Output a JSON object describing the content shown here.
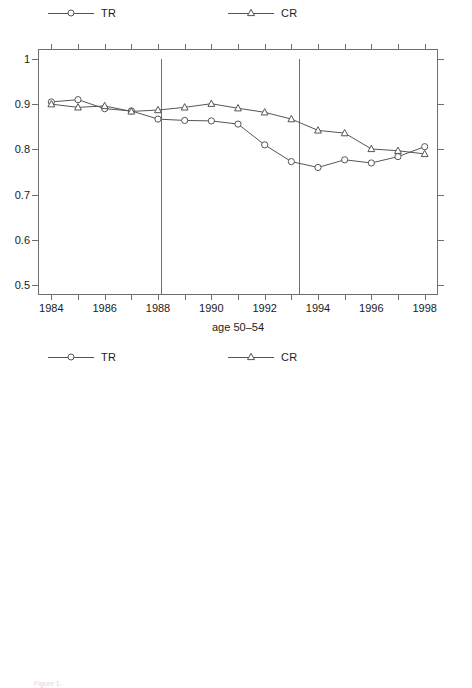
{
  "figure": {
    "caption": "Figure 1.",
    "series_colors": {
      "TR": "#555555",
      "CR": "#555555"
    },
    "axis_color": "#6e6e6e"
  },
  "panels": [
    {
      "id": "panel-age-50-54",
      "legend": [
        {
          "label": "TR",
          "marker": "circle-marker"
        },
        {
          "label": "CR",
          "marker": "triangle-marker"
        }
      ],
      "chart_data": {
        "type": "line",
        "title": "",
        "xlabel": "age 50–54",
        "ylabel": "",
        "x": [
          1984,
          1985,
          1986,
          1987,
          1988,
          1989,
          1990,
          1991,
          1992,
          1993,
          1994,
          1995,
          1996,
          1997,
          1998
        ],
        "xtick_labels": [
          "1984",
          "",
          "1986",
          "",
          "1988",
          "",
          "1990",
          "",
          "1992",
          "",
          "1994",
          "",
          "1996",
          "",
          "1998"
        ],
        "ytick_labels": [
          "0.5",
          "0.6",
          "0.7",
          "0.8",
          "0.9",
          "1"
        ],
        "yticks": [
          0.5,
          0.6,
          0.7,
          0.8,
          0.9,
          1.0
        ],
        "xlim": [
          1983.5,
          1998.5
        ],
        "ylim": [
          0.478,
          1.022
        ],
        "grid": false,
        "legend_position": "above-plot",
        "vertical_reference_lines": [
          1988.1,
          1993.3
        ],
        "series": [
          {
            "name": "TR",
            "marker": "circle-marker",
            "values": [
              0.905,
              0.91,
              0.89,
              0.885,
              0.867,
              0.864,
              0.863,
              0.856,
              0.81,
              0.773,
              0.76,
              0.777,
              0.77,
              0.784,
              0.806
            ]
          },
          {
            "name": "CR",
            "marker": "triangle-marker",
            "values": [
              0.9,
              0.893,
              0.896,
              0.884,
              0.887,
              0.893,
              0.901,
              0.891,
              0.882,
              0.867,
              0.842,
              0.836,
              0.801,
              0.797,
              0.79
            ]
          }
        ]
      }
    },
    {
      "id": "panel-age-55-59",
      "legend": [
        {
          "label": "TR",
          "marker": "circle-marker"
        },
        {
          "label": "CR",
          "marker": "triangle-marker"
        }
      ],
      "chart_data": {
        "type": "line",
        "title": "",
        "xlabel": "age 55–59",
        "ylabel": "",
        "x": [
          1984,
          1985,
          1986,
          1987,
          1988,
          1989,
          1990,
          1991,
          1992,
          1993,
          1994,
          1995,
          1996,
          1997,
          1998
        ],
        "xtick_labels": [
          "1984",
          "",
          "1986",
          "",
          "1988",
          "",
          "1990",
          "",
          "1992",
          "",
          "1994",
          "",
          "1996",
          "",
          "1998"
        ],
        "ytick_labels": [
          "0.5",
          "0.6",
          "0.7",
          "0.8",
          "0.9",
          "1"
        ],
        "yticks": [
          0.5,
          0.6,
          0.7,
          0.8,
          0.9,
          1.0
        ],
        "xlim": [
          1983.5,
          1998.5
        ],
        "ylim": [
          0.425,
          1.022
        ],
        "grid": false,
        "legend_position": "above-plot",
        "vertical_reference_lines": [
          1988.1,
          1993.3
        ],
        "series": [
          {
            "name": "TR",
            "marker": "circle-marker",
            "values": [
              0.67,
              0.602,
              0.59,
              0.532,
              0.489,
              0.5,
              0.489,
              0.487,
              0.443,
              0.433,
              0.437,
              0.473,
              0.466,
              0.488,
              0.494
            ]
          },
          {
            "name": "CR",
            "marker": "triangle-marker",
            "values": [
              0.77,
              0.743,
              0.728,
              0.717,
              0.686,
              0.68,
              0.68,
              0.665,
              0.647,
              0.628,
              0.615,
              0.624,
              0.603,
              0.594,
              0.578
            ]
          }
        ]
      }
    }
  ]
}
